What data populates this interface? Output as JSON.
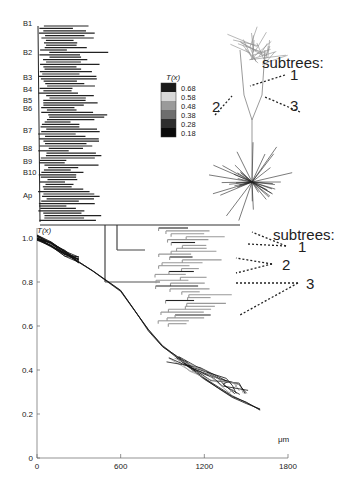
{
  "figure": {
    "branch_labels": [
      "B1",
      "B2",
      "B3",
      "B4",
      "B5",
      "B6",
      "B7",
      "B8",
      "B9",
      "B10",
      "Ap"
    ],
    "branch_label_y": [
      18,
      47,
      72,
      84,
      95,
      103,
      125,
      143,
      156,
      167,
      190
    ],
    "legend": {
      "title": "T(x)",
      "entries": [
        {
          "label": "0.68",
          "color": "#1a1a1a"
        },
        {
          "label": "0.58",
          "color": "#d8d8d8"
        },
        {
          "label": "0.48",
          "color": "#9a9a9a"
        },
        {
          "label": "0.38",
          "color": "#6e6e6e"
        },
        {
          "label": "0.28",
          "color": "#2e2e2e"
        },
        {
          "label": "0.18",
          "color": "#0a0a0a"
        }
      ]
    },
    "annotations_top": {
      "title": "subtrees:",
      "labels": [
        "1",
        "2",
        "3"
      ]
    },
    "annotations_mid": {
      "title": "subtrees:",
      "labels": [
        "1",
        "2",
        "3"
      ]
    }
  },
  "chart_data": {
    "type": "line",
    "title": "",
    "ylabel": "T(x)",
    "xlabel": "μm",
    "x_ticks": [
      "0",
      "600",
      "1200",
      "1800"
    ],
    "y_ticks": [
      "0",
      "0.2",
      "0.4",
      "0.6",
      "0.8",
      "1.0"
    ],
    "xlim": [
      0,
      1800
    ],
    "ylim": [
      0,
      1.0
    ],
    "grid": false,
    "series": [
      {
        "name": "basal dendrites",
        "x": [
          0,
          100,
          200,
          300
        ],
        "y": [
          1.0,
          0.97,
          0.93,
          0.9
        ]
      },
      {
        "name": "apical main trunk",
        "x": [
          0,
          200,
          400,
          600,
          700,
          800,
          900,
          1000,
          1100,
          1200,
          1300,
          1400,
          1500,
          1600
        ],
        "y": [
          1.0,
          0.93,
          0.85,
          0.76,
          0.67,
          0.58,
          0.51,
          0.46,
          0.41,
          0.36,
          0.32,
          0.28,
          0.25,
          0.22
        ]
      },
      {
        "name": "apical tuft loops",
        "x": [
          1000,
          1150,
          1300,
          1400,
          1450
        ],
        "y": [
          0.45,
          0.4,
          0.36,
          0.33,
          0.3
        ]
      }
    ]
  }
}
